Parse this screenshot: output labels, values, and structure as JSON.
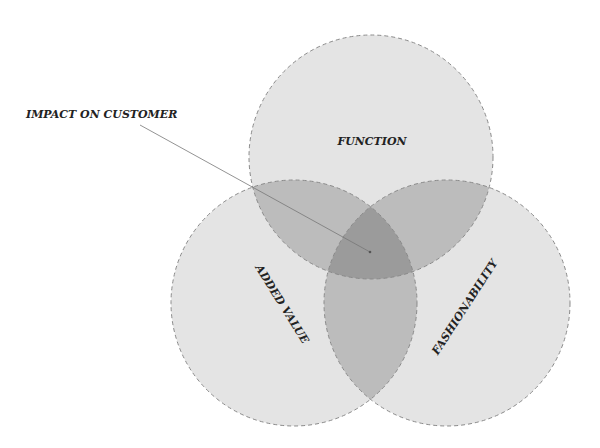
{
  "diagram": {
    "type": "venn",
    "callout": {
      "label": "IMPACT ON CUSTOMER"
    },
    "circles": [
      {
        "id": "function",
        "label": "FUNCTION"
      },
      {
        "id": "added-value",
        "label": "ADDED VALUE"
      },
      {
        "id": "fashionability",
        "label": "FASHIONABILITY"
      }
    ],
    "colors": {
      "single": "#e4e4e4",
      "double": "#bcbcbc",
      "triple": "#9b9b9b",
      "stroke": "#8a8a8a"
    }
  }
}
